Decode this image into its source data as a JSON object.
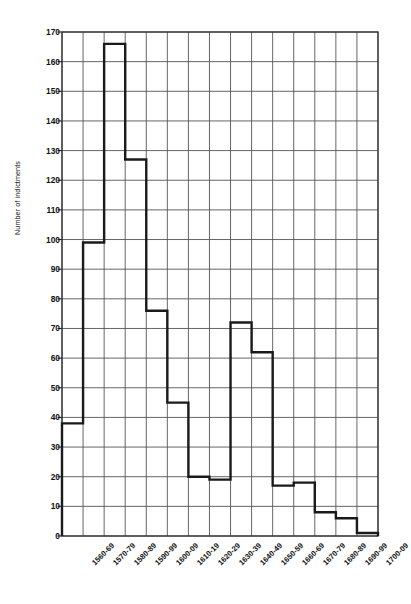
{
  "chart_data": {
    "type": "bar",
    "title": "",
    "subtitle": "",
    "xlabel": "",
    "ylabel": "Number of indictments",
    "categories": [
      "1560-69",
      "1570-79",
      "1580-89",
      "1590-99",
      "1600-09",
      "1610-19",
      "1620-29",
      "1630-39",
      "1640-49",
      "1650-59",
      "1660-69",
      "1670-79",
      "1680-89",
      "1690-99",
      "1700-09"
    ],
    "values": [
      38,
      99,
      166,
      127,
      76,
      45,
      20,
      19,
      72,
      62,
      17,
      18,
      8,
      6,
      1
    ],
    "ylim": [
      0,
      170
    ],
    "ytick_step": 10,
    "yticks": [
      0,
      10,
      20,
      30,
      40,
      50,
      60,
      70,
      80,
      90,
      100,
      110,
      120,
      130,
      140,
      150,
      160,
      170
    ],
    "grid": true,
    "legend": "none",
    "style": "step-outline-histogram",
    "line_color": "#1a1a1a",
    "grid_color": "#555555",
    "background": "#ffffff"
  },
  "axes": {
    "y_title": "Number of indictments"
  }
}
